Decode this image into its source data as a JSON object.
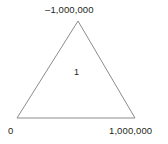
{
  "figure": {
    "shape": "triangle",
    "background_color": "#ffffff",
    "stroke_color": "#8c8c8c",
    "text_color": "#231f20",
    "vertices": {
      "apex": {
        "label": "–1,000,000",
        "x": 78,
        "y": 21
      },
      "bottom_left": {
        "label": "0",
        "x": 17,
        "y": 118
      },
      "bottom_right": {
        "label": "1,000,000",
        "x": 135,
        "y": 118
      }
    },
    "interior": {
      "label": "1",
      "x": 78,
      "y": 73
    }
  }
}
